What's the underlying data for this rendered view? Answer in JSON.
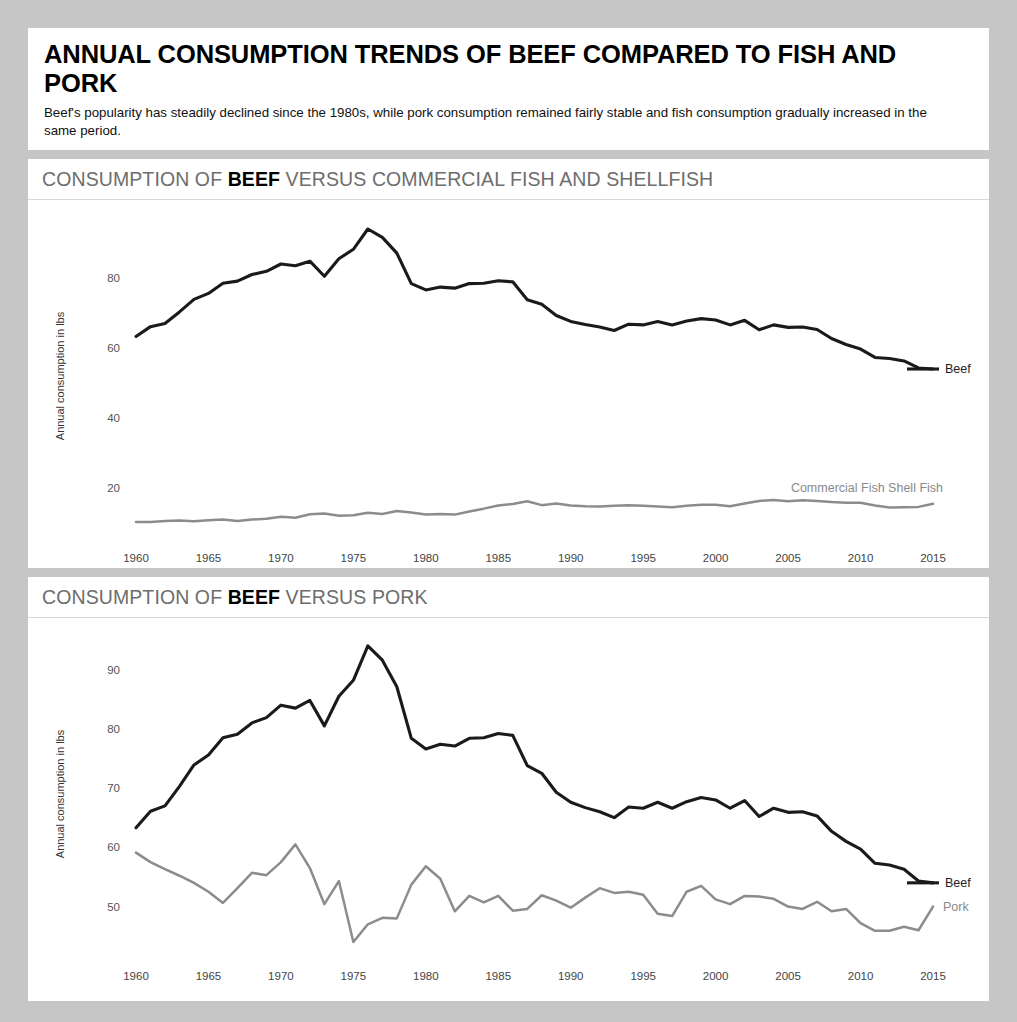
{
  "header": {
    "title": "ANNUAL CONSUMPTION TRENDS OF BEEF COMPARED TO FISH AND PORK",
    "subtitle": "Beef's popularity has steadily declined since the 1980s, while pork consumption remained fairly stable and fish consumption gradually increased in the same period."
  },
  "panel1": {
    "header_prefix": "CONSUMPTION OF ",
    "header_bold": "BEEF",
    "header_suffix": " VERSUS COMMERCIAL FISH AND SHELLFISH"
  },
  "panel2": {
    "header_prefix": "CONSUMPTION OF ",
    "header_bold": "BEEF",
    "header_suffix": " VERSUS PORK"
  },
  "colors": {
    "beef": "#1a1a1a",
    "fish": "#8c8c8c",
    "pork": "#8c8c8c",
    "page_background": "#c6c6c6",
    "panel_background": "#ffffff",
    "header_text": "#6d6d6d"
  },
  "chart_data": [
    {
      "type": "line",
      "title": "CONSUMPTION OF BEEF VERSUS COMMERCIAL FISH AND SHELLFISH",
      "xlabel": "",
      "ylabel": "Annual consumption in lbs",
      "xlim": [
        1960,
        2015
      ],
      "ylim": [
        8,
        96
      ],
      "grid": false,
      "legend_position": "right-inline",
      "xticks": [
        1960,
        1965,
        1970,
        1975,
        1980,
        1985,
        1990,
        1995,
        2000,
        2005,
        2010,
        2015
      ],
      "yticks": [
        20,
        40,
        60,
        80
      ],
      "x": [
        1960,
        1961,
        1962,
        1963,
        1964,
        1965,
        1966,
        1967,
        1968,
        1969,
        1970,
        1971,
        1972,
        1973,
        1974,
        1975,
        1976,
        1977,
        1978,
        1979,
        1980,
        1981,
        1982,
        1983,
        1984,
        1985,
        1986,
        1987,
        1988,
        1989,
        1990,
        1991,
        1992,
        1993,
        1994,
        1995,
        1996,
        1997,
        1998,
        1999,
        2000,
        2001,
        2002,
        2003,
        2004,
        2005,
        2006,
        2007,
        2008,
        2009,
        2010,
        2011,
        2012,
        2013,
        2014,
        2015
      ],
      "series": [
        {
          "name": "Beef",
          "color": "#1a1a1a",
          "values": [
            63.3,
            66.1,
            67.0,
            70.3,
            73.9,
            75.6,
            78.5,
            79.1,
            81.0,
            81.9,
            84.0,
            83.5,
            84.8,
            80.5,
            85.5,
            88.2,
            94.0,
            91.6,
            87.1,
            78.4,
            76.6,
            77.4,
            77.1,
            78.4,
            78.5,
            79.2,
            78.9,
            73.8,
            72.5,
            69.3,
            67.6,
            66.7,
            66.0,
            65.0,
            66.8,
            66.6,
            67.6,
            66.6,
            67.7,
            68.4,
            68.0,
            66.6,
            67.9,
            65.2,
            66.6,
            65.9,
            66.0,
            65.3,
            62.7,
            61.0,
            59.7,
            57.3,
            57.0,
            56.3,
            54.3,
            54.0
          ]
        },
        {
          "name": "Commercial Fish Shell Fish",
          "color": "#8c8c8c",
          "values": [
            10.3,
            10.3,
            10.6,
            10.7,
            10.5,
            10.8,
            11.0,
            10.6,
            11.0,
            11.2,
            11.8,
            11.5,
            12.5,
            12.7,
            12.1,
            12.2,
            12.9,
            12.6,
            13.4,
            13.0,
            12.4,
            12.6,
            12.4,
            13.3,
            14.1,
            15.0,
            15.4,
            16.2,
            15.1,
            15.6,
            15.0,
            14.8,
            14.7,
            14.9,
            15.1,
            14.9,
            14.7,
            14.5,
            14.9,
            15.2,
            15.2,
            14.8,
            15.6,
            16.3,
            16.6,
            16.2,
            16.5,
            16.3,
            16.0,
            15.8,
            15.8,
            15.0,
            14.4,
            14.5,
            14.6,
            15.5
          ]
        }
      ],
      "annotations": [
        {
          "text": "Beef",
          "x": 2015,
          "y": 54.0
        },
        {
          "text": "Commercial Fish Shell Fish",
          "x": 2015,
          "y": 20.0
        }
      ]
    },
    {
      "type": "line",
      "title": "CONSUMPTION OF BEEF VERSUS PORK",
      "xlabel": "",
      "ylabel": "Annual consumption in lbs",
      "xlim": [
        1960,
        2015
      ],
      "ylim": [
        43,
        95
      ],
      "grid": false,
      "legend_position": "right-inline",
      "xticks": [
        1960,
        1965,
        1970,
        1975,
        1980,
        1985,
        1990,
        1995,
        2000,
        2005,
        2010,
        2015
      ],
      "yticks": [
        50,
        60,
        70,
        80,
        90
      ],
      "x": [
        1960,
        1961,
        1962,
        1963,
        1964,
        1965,
        1966,
        1967,
        1968,
        1969,
        1970,
        1971,
        1972,
        1973,
        1974,
        1975,
        1976,
        1977,
        1978,
        1979,
        1980,
        1981,
        1982,
        1983,
        1984,
        1985,
        1986,
        1987,
        1988,
        1989,
        1990,
        1991,
        1992,
        1993,
        1994,
        1995,
        1996,
        1997,
        1998,
        1999,
        2000,
        2001,
        2002,
        2003,
        2004,
        2005,
        2006,
        2007,
        2008,
        2009,
        2010,
        2011,
        2012,
        2013,
        2014,
        2015
      ],
      "series": [
        {
          "name": "Beef",
          "color": "#1a1a1a",
          "values": [
            63.3,
            66.1,
            67.0,
            70.3,
            73.9,
            75.6,
            78.5,
            79.1,
            81.0,
            81.9,
            84.0,
            83.5,
            84.8,
            80.5,
            85.5,
            88.2,
            94.0,
            91.6,
            87.1,
            78.4,
            76.6,
            77.4,
            77.1,
            78.4,
            78.5,
            79.2,
            78.9,
            73.8,
            72.5,
            69.3,
            67.6,
            66.7,
            66.0,
            65.0,
            66.8,
            66.6,
            67.6,
            66.6,
            67.7,
            68.4,
            68.0,
            66.6,
            67.9,
            65.2,
            66.6,
            65.9,
            66.0,
            65.3,
            62.7,
            61.0,
            59.7,
            57.3,
            57.0,
            56.3,
            54.3,
            54.0
          ]
        },
        {
          "name": "Pork",
          "color": "#8c8c8c",
          "values": [
            59.1,
            57.5,
            56.3,
            55.2,
            54.0,
            52.5,
            50.6,
            53.1,
            55.7,
            55.3,
            57.5,
            60.5,
            56.5,
            50.4,
            54.3,
            44.0,
            47.0,
            48.1,
            48.0,
            53.7,
            56.8,
            54.7,
            49.2,
            51.8,
            50.7,
            51.8,
            49.3,
            49.6,
            51.9,
            51.0,
            49.8,
            51.5,
            53.1,
            52.3,
            52.5,
            52.0,
            48.8,
            48.4,
            52.5,
            53.5,
            51.2,
            50.4,
            51.8,
            51.7,
            51.3,
            50.0,
            49.6,
            50.8,
            49.2,
            49.6,
            47.2,
            45.9,
            45.9,
            46.6,
            46.0,
            50.0
          ]
        }
      ],
      "annotations": [
        {
          "text": "Beef",
          "x": 2015,
          "y": 54.0
        },
        {
          "text": "Pork",
          "x": 2015,
          "y": 50.0
        }
      ]
    }
  ]
}
